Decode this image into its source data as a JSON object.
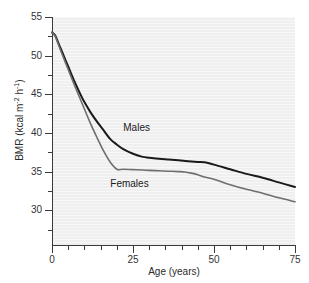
{
  "chart_data": {
    "type": "line",
    "title": "",
    "xlabel": "Age (years)",
    "ylabel": "BMR (kcal m⁻² h⁻¹)",
    "ylabel_parts": {
      "prefix": "BMR (kcal m",
      "sup1": "-2",
      "mid": " h",
      "sup2": "-1",
      "suffix": ")"
    },
    "xlim": [
      0,
      75
    ],
    "ylim": [
      25.5,
      55
    ],
    "xticks": [
      0,
      25,
      50,
      75
    ],
    "xtick_labels": [
      "0",
      "25",
      "50",
      "75"
    ],
    "xticks_minor": [
      5,
      10,
      15,
      20,
      30,
      35,
      40,
      45,
      55,
      60,
      65,
      70
    ],
    "yticks": [
      30,
      35,
      40,
      45,
      50,
      55
    ],
    "ytick_labels": [
      "30",
      "35",
      "40",
      "45",
      "50",
      "55"
    ],
    "yticks_minor": [
      27.5,
      32.5,
      37.5,
      42.5,
      47.5,
      52.5
    ],
    "grid": false,
    "legend_position": "inline-annotations",
    "plot_background": "#efefef",
    "series": [
      {
        "name": "Males",
        "color": "#1a1a1a",
        "width": 2.0,
        "label_x": 22,
        "label_y": 40.6,
        "x": [
          0,
          1,
          2,
          3,
          5,
          7,
          9,
          10,
          12,
          14,
          16,
          18,
          20,
          22,
          25,
          28,
          30,
          33,
          36,
          39,
          42,
          45,
          47,
          50,
          55,
          60,
          65,
          70,
          75
        ],
        "y": [
          53.0,
          52.6,
          51.6,
          50.6,
          48.6,
          46.6,
          44.8,
          44.0,
          42.6,
          41.4,
          40.3,
          39.2,
          38.5,
          37.9,
          37.3,
          36.9,
          36.8,
          36.65,
          36.55,
          36.45,
          36.35,
          36.25,
          36.2,
          35.9,
          35.3,
          34.7,
          34.2,
          33.6,
          33.0
        ]
      },
      {
        "name": "Females",
        "color": "#6e6e6e",
        "width": 1.6,
        "label_x": 18,
        "label_y": 33.4,
        "x": [
          0,
          1,
          2,
          3,
          5,
          7,
          9,
          10,
          12,
          14,
          16,
          18,
          20,
          22,
          25,
          28,
          30,
          33,
          36,
          39,
          41,
          43,
          45,
          47,
          50,
          55,
          60,
          65,
          70,
          75
        ],
        "y": [
          53.0,
          52.5,
          51.4,
          50.3,
          48.2,
          46.1,
          44.1,
          43.1,
          41.1,
          39.3,
          37.6,
          36.2,
          35.3,
          35.3,
          35.25,
          35.2,
          35.15,
          35.1,
          35.05,
          35.0,
          34.95,
          34.8,
          34.6,
          34.3,
          34.0,
          33.3,
          32.7,
          32.2,
          31.6,
          31.1
        ]
      }
    ]
  }
}
